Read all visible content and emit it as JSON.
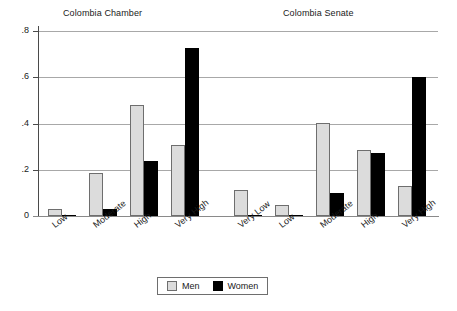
{
  "chart_data": {
    "type": "bar",
    "title": "",
    "xlabel": "",
    "ylabel": "",
    "ylim": [
      0,
      0.8
    ],
    "yticks": [
      0,
      0.2,
      0.4,
      0.6,
      0.8
    ],
    "ytick_labels": [
      "0",
      ".2",
      ".4",
      ".6",
      ".8"
    ],
    "grid": true,
    "legend_position": "bottom-center",
    "legend": [
      "Men",
      "Women"
    ],
    "series": [
      {
        "name": "Men",
        "color": "#dcdcdc"
      },
      {
        "name": "Women",
        "color": "#000000"
      }
    ],
    "panels": [
      {
        "title": "Colombia Chamber",
        "categories": [
          "Low",
          "Moderate",
          "High",
          "Very High"
        ],
        "series": [
          {
            "name": "Men",
            "values": [
              0.03,
              0.185,
              0.478,
              0.307
            ]
          },
          {
            "name": "Women",
            "values": [
              0.006,
              0.032,
              0.237,
              0.728
            ]
          }
        ]
      },
      {
        "title": "Colombia Senate",
        "categories": [
          "Very Low",
          "Low",
          "Moderate",
          "High",
          "Very High"
        ],
        "series": [
          {
            "name": "Men",
            "values": [
              0.113,
              0.048,
              0.404,
              0.287,
              0.128
            ]
          },
          {
            "name": "Women",
            "values": [
              0.006,
              0.005,
              0.1,
              0.272,
              0.603
            ]
          }
        ]
      }
    ]
  },
  "axis": {
    "ytick_labels": [
      "0",
      ".2",
      ".4",
      ".6",
      ".8"
    ]
  },
  "titles": {
    "chamber": "Colombia Chamber",
    "senate": "Colombia Senate"
  },
  "legend": {
    "men": "Men",
    "women": "Women"
  }
}
